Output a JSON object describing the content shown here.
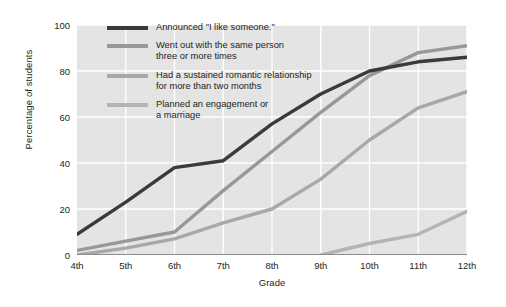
{
  "chart_data": {
    "type": "line",
    "title": "",
    "xlabel": "Grade",
    "ylabel": "Percentage of students",
    "categories": [
      "4th",
      "5th",
      "6th",
      "7th",
      "8th",
      "9th",
      "10th",
      "11th",
      "12th"
    ],
    "ylim": [
      0,
      100
    ],
    "yticks": [
      0,
      20,
      40,
      60,
      80,
      100
    ],
    "grid": true,
    "legend_position": "top-left inside plot",
    "series": [
      {
        "name": "Announced \"I like someone.\"",
        "color": "#3a3a3a",
        "values": [
          9,
          23,
          38,
          41,
          57,
          70,
          80,
          84,
          86
        ]
      },
      {
        "name": "Went out with the same person\nthree or more times",
        "color": "#989898",
        "values": [
          2,
          6,
          10,
          28,
          45,
          62,
          78,
          88,
          91
        ]
      },
      {
        "name": "Had a sustained romantic relationship\nfor more than two months",
        "color": "#a8a8a8",
        "values": [
          0,
          3,
          7,
          14,
          20,
          33,
          50,
          64,
          71
        ]
      },
      {
        "name": "Planned an engagement or\na marriage",
        "color": "#b4b4b4",
        "values": [
          null,
          null,
          null,
          null,
          null,
          0,
          5,
          9,
          19
        ]
      }
    ]
  },
  "legend": {
    "items": [
      {
        "label": "Announced \"I like someone.\"",
        "color": "#3a3a3a"
      },
      {
        "label": "Went out with the same person\nthree or more times",
        "color": "#989898"
      },
      {
        "label": "Had a sustained romantic relationship\nfor more than two months",
        "color": "#a8a8a8"
      },
      {
        "label": "Planned an engagement or\na marriage",
        "color": "#b4b4b4"
      }
    ]
  },
  "style": {
    "plot_background": "#e4e4e4",
    "grid_color": "#ffffff",
    "axis_color": "#8c8c8c",
    "page_background": "#ffffff",
    "text_color": "#231f20"
  }
}
